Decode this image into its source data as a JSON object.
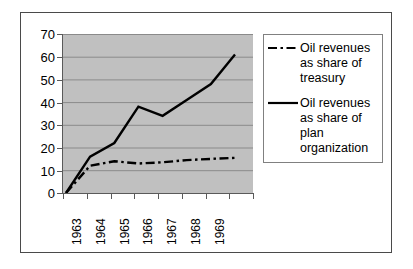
{
  "chart_data": {
    "type": "line",
    "title": "",
    "subtitle": "",
    "xlabel": "",
    "ylabel": "",
    "x": [
      1963,
      1964,
      1965,
      1966,
      1967,
      1968,
      1969,
      1970
    ],
    "categories": [
      "1963",
      "1964",
      "1965",
      "1966",
      "1967",
      "1968",
      "1969",
      ""
    ],
    "xtick_labels": [
      "1963",
      "1964",
      "1965",
      "1966",
      "1967",
      "1968",
      "1969"
    ],
    "ytick_labels": [
      "0",
      "10",
      "20",
      "30",
      "40",
      "50",
      "60",
      "70"
    ],
    "yticks": [
      0,
      10,
      20,
      30,
      40,
      50,
      60,
      70
    ],
    "ylim": [
      0,
      70
    ],
    "grid": "horizontal",
    "plot_background": "#c0c0c0",
    "legend_position": "right",
    "series": [
      {
        "name": "Oil revenues as share of treasury",
        "style": "dash-dot",
        "color": "#000000",
        "values": [
          0,
          12,
          14,
          13,
          13.5,
          14.5,
          15,
          15.5
        ]
      },
      {
        "name": "Oil revenues as share of plan organization",
        "style": "solid",
        "color": "#000000",
        "values": [
          0,
          16,
          22,
          38,
          34,
          41,
          48,
          61
        ]
      }
    ]
  },
  "legend": {
    "entries": [
      {
        "label_lines": [
          "Oil revenues",
          "as share of",
          "treasury"
        ],
        "label": "Oil revenues as share of treasury",
        "sample": "dash-dot-line-sample"
      },
      {
        "label_lines": [
          "Oil revenues",
          "as share of",
          "plan",
          "organization"
        ],
        "label": "Oil revenues as share of plan organization",
        "sample": "solid-line-sample"
      }
    ]
  },
  "axis": {
    "y_labels": [
      "70",
      "60",
      "50",
      "40",
      "30",
      "20",
      "10",
      "0"
    ],
    "x_labels": [
      "1963",
      "1964",
      "1965",
      "1966",
      "1967",
      "1968",
      "1969"
    ]
  }
}
